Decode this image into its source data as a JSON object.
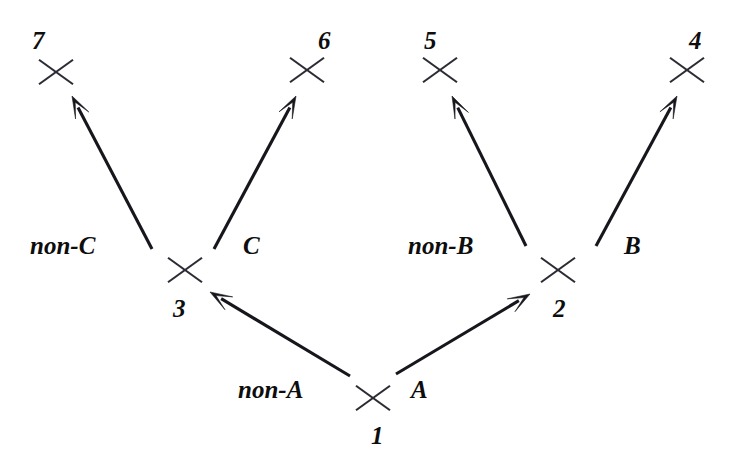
{
  "diagram": {
    "background_color": "#ffffff",
    "ink_color": "#16161c",
    "node_mark_color": "#2b2b33",
    "nodes": [
      {
        "id": "node-1",
        "label": "1",
        "x": 373,
        "y": 398,
        "label_x": 371,
        "label_y": 423
      },
      {
        "id": "node-2",
        "label": "2",
        "x": 558,
        "y": 270,
        "label_x": 553,
        "label_y": 296
      },
      {
        "id": "node-3",
        "label": "3",
        "x": 185,
        "y": 270,
        "label_x": 173,
        "label_y": 296
      },
      {
        "id": "node-4",
        "label": "4",
        "x": 687,
        "y": 70,
        "label_x": 689,
        "label_y": 28
      },
      {
        "id": "node-5",
        "label": "5",
        "x": 440,
        "y": 70,
        "label_x": 424,
        "label_y": 28
      },
      {
        "id": "node-6",
        "label": "6",
        "x": 307,
        "y": 70,
        "label_x": 318,
        "label_y": 28
      },
      {
        "id": "node-7",
        "label": "7",
        "x": 56,
        "y": 72,
        "label_x": 32,
        "label_y": 28
      }
    ],
    "edges": [
      {
        "id": "edge-non-a",
        "label": "non-A",
        "from": "node-1",
        "to": "node-3",
        "x1": 350,
        "y1": 376,
        "x2": 210,
        "y2": 292,
        "label_x": 238,
        "label_y": 377
      },
      {
        "id": "edge-a",
        "label": "A",
        "from": "node-1",
        "to": "node-2",
        "x1": 396,
        "y1": 374,
        "x2": 530,
        "y2": 294,
        "label_x": 411,
        "label_y": 377
      },
      {
        "id": "edge-non-c",
        "label": "non-C",
        "from": "node-3",
        "to": "node-7",
        "x1": 152,
        "y1": 249,
        "x2": 72,
        "y2": 96,
        "label_x": 30,
        "label_y": 233
      },
      {
        "id": "edge-c",
        "label": "C",
        "from": "node-3",
        "to": "node-6",
        "x1": 214,
        "y1": 249,
        "x2": 296,
        "y2": 96,
        "label_x": 243,
        "label_y": 233
      },
      {
        "id": "edge-non-b",
        "label": "non-B",
        "from": "node-2",
        "to": "node-5",
        "x1": 526,
        "y1": 246,
        "x2": 452,
        "y2": 96,
        "label_x": 408,
        "label_y": 233
      },
      {
        "id": "edge-b",
        "label": "B",
        "from": "node-2",
        "to": "node-4",
        "x1": 596,
        "y1": 246,
        "x2": 677,
        "y2": 96,
        "label_x": 624,
        "label_y": 233
      }
    ]
  }
}
